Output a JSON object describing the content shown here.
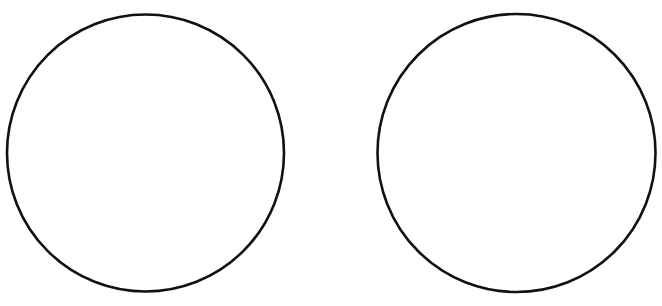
{
  "canvas": {
    "width": 662,
    "height": 306,
    "background": "#ffffff"
  },
  "shapes": [
    {
      "id": "left-circle",
      "type": "circle",
      "cx": 145.5,
      "cy": 153,
      "r": 138.5,
      "stroke": "#111111",
      "stroke_width": 2.6,
      "fill": "none"
    },
    {
      "id": "right-circle",
      "type": "circle",
      "cx": 516.5,
      "cy": 153,
      "r": 139,
      "stroke": "#111111",
      "stroke_width": 2.6,
      "fill": "none"
    }
  ]
}
